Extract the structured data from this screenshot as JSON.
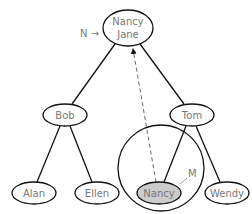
{
  "diagram": {
    "nodes": [
      {
        "id": "root",
        "label_line1": "Nancy",
        "label_line2": "Jane",
        "cx": 128,
        "cy": 28,
        "rx": 25,
        "ry": 18,
        "highlight": false
      },
      {
        "id": "bob",
        "label": "Bob",
        "cx": 65,
        "cy": 115,
        "rx": 22,
        "ry": 11,
        "highlight": false
      },
      {
        "id": "tom",
        "label": "Tom",
        "cx": 192,
        "cy": 115,
        "rx": 22,
        "ry": 11,
        "highlight": false
      },
      {
        "id": "alan",
        "label": "Alan",
        "cx": 34,
        "cy": 193,
        "rx": 22,
        "ry": 11,
        "highlight": false
      },
      {
        "id": "ellen",
        "label": "Ellen",
        "cx": 97,
        "cy": 193,
        "rx": 22,
        "ry": 11,
        "highlight": false
      },
      {
        "id": "nancy",
        "label": "Nancy",
        "cx": 159,
        "cy": 193,
        "rx": 22,
        "ry": 11,
        "highlight": true
      },
      {
        "id": "wendy",
        "label": "Wendy",
        "cx": 227,
        "cy": 193,
        "rx": 22,
        "ry": 11,
        "highlight": false
      }
    ],
    "pointer_N": {
      "label": "N →"
    },
    "pointer_M": {
      "label": "M"
    },
    "colors": {
      "stroke": "#111111",
      "text": "#777777",
      "highlight_fill": "#cccccc",
      "dashed": "#666666"
    }
  }
}
